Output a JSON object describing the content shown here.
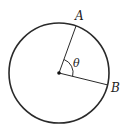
{
  "diagram": {
    "type": "circle-central-angle",
    "labels": {
      "point_a": "A",
      "point_b": "B",
      "angle": "θ"
    },
    "colors": {
      "stroke": "#2a2a2a",
      "background": "#ffffff"
    }
  }
}
